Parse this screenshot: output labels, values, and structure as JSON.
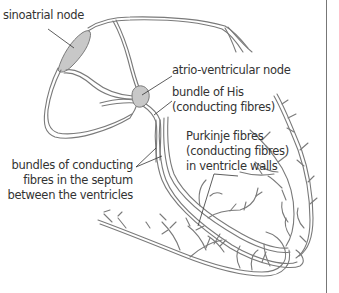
{
  "diagram": {
    "labels": {
      "sinoatrial": [
        "sinoatrial node"
      ],
      "av_node": [
        "atrio-ventricular node"
      ],
      "bundle_his": [
        "bundle of His",
        "(conducting fibres)"
      ],
      "purkinje": [
        "Purkinje fibres",
        "(conducting fibres)",
        "in ventricle walls"
      ],
      "septum_bundles": [
        "bundles of conducting",
        "fibres in the septum",
        "between the ventricles"
      ]
    },
    "colors": {
      "fibre_stroke": "#7a7a7a",
      "fibre_fill": "#d4d4d4",
      "node_fill": "#c8c8c8",
      "text": "#333333",
      "leader": "#333333",
      "frame_border": "#777777"
    }
  }
}
